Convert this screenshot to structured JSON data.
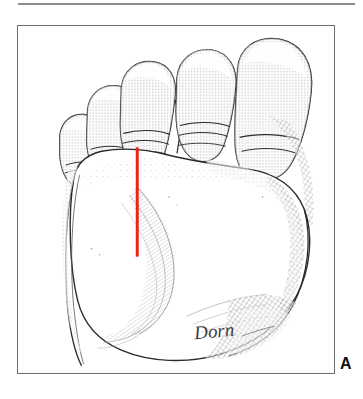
{
  "figure": {
    "panel_label": "A",
    "artist_signature": "Dorn",
    "caption_rule": "",
    "view": "plantar (sole) view, right foot",
    "frame": {
      "border_color": "#6e6e6e",
      "background_color": "#ffffff"
    },
    "top_rule": {
      "color": "#8c8c8c"
    },
    "annotation": {
      "name": "incision-line",
      "color": "#ee2118",
      "description": "red vertical incision marking line in the second web space",
      "x": 137,
      "y_start": 147,
      "y_end": 257,
      "length_px": 110,
      "stroke_width": 3
    },
    "anatomy": {
      "ink_color": "#2b2b2b",
      "stipple_color": "#4a4a4a",
      "toes": [
        {
          "name": "fifth-toe",
          "label": "5th toe"
        },
        {
          "name": "fourth-toe",
          "label": "4th toe"
        },
        {
          "name": "third-toe",
          "label": "3rd toe"
        },
        {
          "name": "second-toe",
          "label": "2nd toe"
        },
        {
          "name": "hallux",
          "label": "great toe (hallux)"
        }
      ],
      "regions": [
        {
          "name": "forefoot-pad",
          "label": "metatarsal fat pad"
        },
        {
          "name": "plantar-arch",
          "label": "medial longitudinal arch"
        },
        {
          "name": "lateral-border",
          "label": "lateral border of foot"
        },
        {
          "name": "heel-area",
          "label": "proximal sole"
        }
      ]
    }
  }
}
